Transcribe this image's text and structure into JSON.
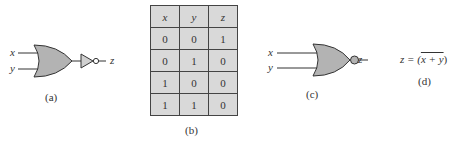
{
  "figure_a": {
    "gate": "OR gate followed by NOT gate",
    "inputs": [
      "x",
      "y"
    ],
    "output": "z",
    "caption": "(a)"
  },
  "figure_b": {
    "caption": "(b)",
    "headers": [
      "x",
      "y",
      "z"
    ],
    "rows": [
      [
        "0",
        "0",
        "1"
      ],
      [
        "0",
        "1",
        "0"
      ],
      [
        "1",
        "0",
        "0"
      ],
      [
        "1",
        "1",
        "0"
      ]
    ]
  },
  "figure_c": {
    "gate": "NOR gate",
    "inputs": [
      "x",
      "y"
    ],
    "output": "z",
    "caption": "(c)"
  },
  "figure_d": {
    "lhs": "z = (",
    "overlined": "x + y",
    "rhs": ")",
    "caption": "(d)"
  },
  "colors": {
    "gate_fill": "#b3b3b3",
    "table_fill": "#d9d9d9",
    "stroke": "#333333"
  }
}
